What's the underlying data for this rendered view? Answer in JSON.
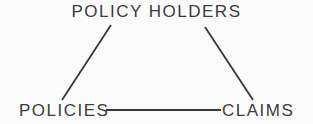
{
  "diagram": {
    "type": "triangle-relationship",
    "nodes": {
      "top": {
        "label": "POLICY HOLDERS"
      },
      "bottom_left": {
        "label": "POLICIES"
      },
      "bottom_right": {
        "label": "CLAIMS"
      }
    },
    "edges": [
      {
        "from": "POLICY HOLDERS",
        "to": "POLICIES"
      },
      {
        "from": "POLICY HOLDERS",
        "to": "CLAIMS"
      },
      {
        "from": "POLICIES",
        "to": "CLAIMS"
      }
    ],
    "colors": {
      "ink": "#3c3c3c",
      "line": "#383838",
      "background": "#fbfbfb"
    }
  }
}
